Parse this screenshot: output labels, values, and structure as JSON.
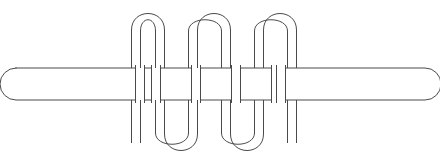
{
  "figure": {
    "title": "Wire coiled around a cylindrical rod",
    "background_color": "#ffffff",
    "stroke_color": "#4a4a4a",
    "stroke_width": 1,
    "canvas": {
      "width": 440,
      "height": 164
    }
  },
  "rod": {
    "name": "rod",
    "label": "rod",
    "fill_color": "#ffffff",
    "stroke_color": "#4a4a4a",
    "left_x": 16,
    "right_x": 425,
    "top_y": 68,
    "bottom_y": 100,
    "corner_radius": 16,
    "end_style": "rounded"
  },
  "wire": {
    "name": "wire",
    "label": "wire",
    "fill_color": "#ffffff",
    "stroke_color": "#4a4a4a",
    "thickness": 9,
    "turns": 4,
    "top_arch_centers": [
      148,
      188,
      228,
      268
    ],
    "bottom_arch_centers": [
      168,
      208,
      248
    ],
    "top_y": 13,
    "bottom_y": 155,
    "lead_left_x": 136,
    "lead_right_x": 277,
    "lead_end_y": 143
  },
  "geometry": {
    "paths": {
      "wire_outer": "M 131.5 143 L 131.5 30 C 131.5 8 164.5 8 164.5 30 L 164.5 134 C 164.5 156 197.5 156 197.5 134 L 197.5 30 C 197.5 8 230.5 8 230.5 30 L 230.5 134 C 230.5 156 263.5 156 263.5 134 L 263.5 30 C 263.5 8 296.5 8 296.5 30 L 296.5 143",
      "wire_inner": "M 140.5 143 L 140.5 31 C 140.5 16 155.5 16 155.5 31 L 155.5 133 C 155.5 148 188.5 148 188.5 133 L 188.5 31 C 188.5 16 221.5 16 221.5 31 L 221.5 133 C 221.5 148 254.5 148 254.5 133 L 254.5 31 C 254.5 16 287.5 16 287.5 31 L 287.5 143"
    }
  }
}
